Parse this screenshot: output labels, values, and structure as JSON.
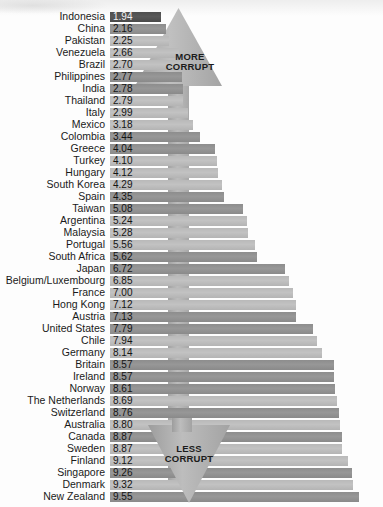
{
  "chart_data": {
    "type": "bar",
    "orientation": "horizontal",
    "title": "",
    "subtitle": "",
    "xlabel": "",
    "ylabel": "",
    "xlim": [
      0,
      10
    ],
    "grid": false,
    "legend_position": "none",
    "annotations": [
      {
        "name": "more-corrupt-arrow",
        "text": "MORE\nCORRUPT",
        "direction": "up",
        "position": "top-center"
      },
      {
        "name": "less-corrupt-arrow",
        "text": "LESS\nCORRUPT",
        "direction": "down",
        "position": "bottom-center"
      }
    ],
    "categories": [
      "Indonesia",
      "China",
      "Pakistan",
      "Venezuela",
      "Brazil",
      "Philippines",
      "India",
      "Thailand",
      "Italy",
      "Mexico",
      "Colombia",
      "Greece",
      "Turkey",
      "Hungary",
      "South Korea",
      "Spain",
      "Taiwan",
      "Argentina",
      "Malaysia",
      "Portugal",
      "South Africa",
      "Japan",
      "Belgium/Luxembourg",
      "France",
      "Hong Kong",
      "Austria",
      "United States",
      "Chile",
      "Germany",
      "Britain",
      "Ireland",
      "Norway",
      "The Netherlands",
      "Switzerland",
      "Australia",
      "Canada",
      "Sweden",
      "Finland",
      "Singapore",
      "Denmark",
      "New Zealand"
    ],
    "values": [
      1.94,
      2.16,
      2.25,
      2.66,
      2.7,
      2.77,
      2.78,
      2.79,
      2.99,
      3.18,
      3.44,
      4.04,
      4.1,
      4.12,
      4.29,
      4.35,
      5.08,
      5.24,
      5.28,
      5.56,
      5.62,
      6.72,
      6.85,
      7.0,
      7.12,
      7.13,
      7.79,
      7.94,
      8.14,
      8.57,
      8.57,
      8.61,
      8.69,
      8.76,
      8.8,
      8.87,
      8.87,
      9.12,
      9.26,
      9.32,
      9.55
    ],
    "value_labels": [
      "1.94",
      "2.16",
      "2.25",
      "2.66",
      "2.70",
      "2.77",
      "2.78",
      "2.79",
      "2.99",
      "3.18",
      "3.44",
      "4.04",
      "4.10",
      "4.12",
      "4.29",
      "4.35",
      "5.08",
      "5.24",
      "5.28",
      "5.56",
      "5.62",
      "6.72",
      "6.85",
      "7.00",
      "7.12",
      "7.13",
      "7.79",
      "7.94",
      "8.14",
      "8.57",
      "8.57",
      "8.61",
      "8.69",
      "8.76",
      "8.80",
      "8.87",
      "8.87",
      "9.12",
      "9.26",
      "9.32",
      "9.55"
    ],
    "bar_tones": [
      "darkest",
      "dark",
      "light",
      "light",
      "light",
      "dark",
      "dark",
      "light",
      "light",
      "light",
      "dark",
      "dark",
      "light",
      "light",
      "light",
      "dark",
      "dark",
      "light",
      "light",
      "light",
      "dark",
      "dark",
      "light",
      "light",
      "light",
      "dark",
      "dark",
      "light",
      "light",
      "dark",
      "dark",
      "dark",
      "light",
      "dark",
      "light",
      "dark",
      "light",
      "light",
      "dark",
      "light",
      "dark"
    ]
  },
  "colors": {
    "bar_dark": "#8d8d8d",
    "bar_light": "#b9b9b9",
    "bar_darkest": "#4d4d4d",
    "arrow_fill": "#b0b0b0",
    "text": "#1a1a1a",
    "background": "#fdfdfd"
  }
}
